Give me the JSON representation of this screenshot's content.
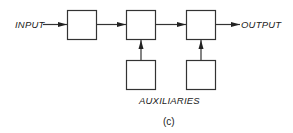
{
  "diagram": {
    "input_label": "INPUT",
    "output_label": "OUTPUT",
    "auxiliaries_label": "AUXILIARIES",
    "caption": "(c)",
    "main_blocks": [
      {
        "id": "block-1",
        "label": ""
      },
      {
        "id": "block-2",
        "label": ""
      },
      {
        "id": "block-3",
        "label": ""
      }
    ],
    "auxiliary_blocks": [
      {
        "id": "aux-1",
        "feeds": "block-2",
        "label": ""
      },
      {
        "id": "aux-2",
        "feeds": "block-3",
        "label": ""
      }
    ],
    "connections": [
      {
        "from": "INPUT",
        "to": "block-1"
      },
      {
        "from": "block-1",
        "to": "block-2"
      },
      {
        "from": "block-2",
        "to": "block-3"
      },
      {
        "from": "block-3",
        "to": "OUTPUT"
      },
      {
        "from": "aux-1",
        "to": "block-2"
      },
      {
        "from": "aux-2",
        "to": "block-3"
      }
    ]
  }
}
